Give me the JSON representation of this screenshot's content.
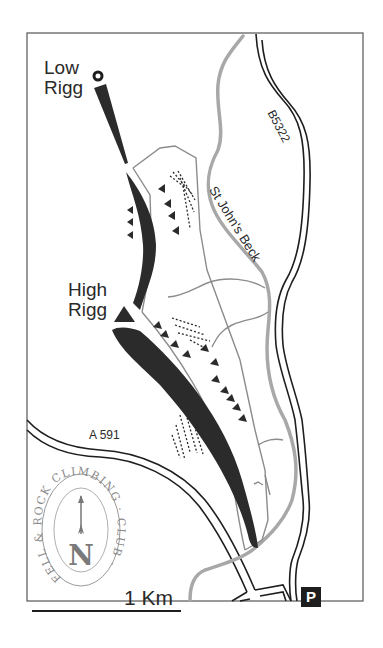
{
  "map": {
    "places": {
      "low_rigg": {
        "line1": "Low",
        "line2": "Rigg"
      },
      "high_rigg": {
        "line1": "High",
        "line2": "Rigg"
      }
    },
    "roads": {
      "b_road": "B5322",
      "a_road": "A 591"
    },
    "water": {
      "beck": "St John's Beck"
    },
    "scale_bar": {
      "label": "1 Km"
    },
    "parking": {
      "label": "P"
    },
    "logo": {
      "ring_text": "FELL & ROCK CLIMBING · CLUB ·",
      "north_letter": "N"
    },
    "colors": {
      "crag": "#2b2b2b",
      "river": "#a8a8a8",
      "path": "#8c8c8c",
      "road": "#1e1e1e",
      "frame": "#555555",
      "logo": "#9a9a9a"
    }
  }
}
